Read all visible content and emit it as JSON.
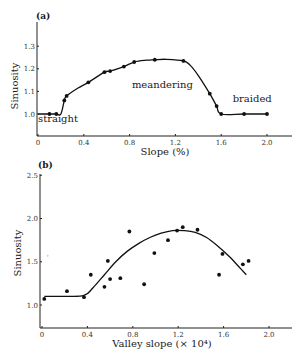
{
  "chart_data": [
    {
      "panel": "(a)",
      "type": "line",
      "title": "",
      "xlabel": "Slope (%)",
      "ylabel": "Sinuosity",
      "xlim": [
        0,
        2.2
      ],
      "ylim": [
        0.9,
        1.37
      ],
      "xticks": [
        0,
        0.4,
        0.8,
        1.2,
        1.6,
        2.0
      ],
      "xtick_labels": [
        "0",
        "0.4",
        "0.8",
        "1.2",
        "1.6",
        "2.0"
      ],
      "yticks": [
        1.0,
        1.1,
        1.2,
        1.3
      ],
      "ytick_labels": [
        "1.0",
        "1.1",
        "1.2",
        "1.3"
      ],
      "grid": false,
      "legend": null,
      "annotations": [
        {
          "text": "straight",
          "x": 0.0,
          "y": 0.965
        },
        {
          "text": "meandering",
          "x": 0.82,
          "y": 1.115
        },
        {
          "text": "braided",
          "x": 1.7,
          "y": 1.055
        }
      ],
      "series": [
        {
          "name": "observed",
          "style": "markers+line",
          "x": [
            0.1,
            0.16,
            0.23,
            0.25,
            0.44,
            0.58,
            0.63,
            0.75,
            0.84,
            1.02,
            1.27,
            1.5,
            1.56,
            1.6,
            1.8,
            2.0
          ],
          "y": [
            1.0,
            1.0,
            1.06,
            1.08,
            1.14,
            1.185,
            1.19,
            1.21,
            1.23,
            1.24,
            1.235,
            1.09,
            1.035,
            1.0,
            1.0,
            1.0
          ]
        }
      ],
      "curve": {
        "x": [
          0.0,
          0.1,
          0.16,
          0.2,
          0.23,
          0.25,
          0.35,
          0.44,
          0.58,
          0.63,
          0.75,
          0.84,
          0.95,
          1.02,
          1.12,
          1.27,
          1.33,
          1.4,
          1.5,
          1.56,
          1.6,
          1.8,
          2.0
        ],
        "y": [
          1.0,
          1.0,
          1.0,
          1.0,
          1.06,
          1.08,
          1.115,
          1.14,
          1.185,
          1.19,
          1.21,
          1.23,
          1.238,
          1.24,
          1.242,
          1.235,
          1.215,
          1.17,
          1.09,
          1.035,
          1.0,
          1.0,
          1.0
        ]
      }
    },
    {
      "panel": "(b)",
      "type": "scatter",
      "title": "",
      "xlabel": "Valley slope (× 10⁴)",
      "ylabel": "Sinuosity",
      "xlim": [
        0,
        2.2
      ],
      "ylim": [
        0.73,
        2.5
      ],
      "xticks": [
        0,
        0.4,
        0.8,
        1.2,
        1.6,
        2.0
      ],
      "xtick_labels": [
        "0",
        "0.4",
        "0.8",
        "1.2",
        "1.6",
        "2.0"
      ],
      "yticks": [
        1.0,
        1.5,
        2.0,
        2.5
      ],
      "ytick_labels": [
        "1.0",
        "1.5",
        "2.0",
        "2.5"
      ],
      "grid": false,
      "legend": null,
      "series": [
        {
          "name": "observed",
          "style": "markers",
          "x": [
            0.02,
            0.22,
            0.37,
            0.43,
            0.55,
            0.58,
            0.6,
            0.69,
            0.77,
            0.9,
            0.99,
            1.11,
            1.19,
            1.24,
            1.37,
            1.56,
            1.59,
            1.77,
            1.82
          ],
          "y": [
            1.07,
            1.16,
            1.09,
            1.35,
            1.21,
            1.51,
            1.3,
            1.31,
            1.85,
            1.24,
            1.6,
            1.75,
            1.86,
            1.9,
            1.87,
            1.35,
            1.59,
            1.47,
            1.51
          ]
        }
      ],
      "curve": {
        "name": "fitted trend",
        "x": [
          0.02,
          0.2,
          0.37,
          0.45,
          0.55,
          0.65,
          0.75,
          0.85,
          0.95,
          1.05,
          1.15,
          1.25,
          1.35,
          1.45,
          1.55,
          1.65,
          1.75,
          1.8
        ],
        "y": [
          1.1,
          1.1,
          1.11,
          1.2,
          1.35,
          1.5,
          1.62,
          1.71,
          1.78,
          1.83,
          1.86,
          1.86,
          1.84,
          1.78,
          1.68,
          1.56,
          1.42,
          1.35
        ]
      },
      "artifacts": [
        {
          "x": 0.05,
          "y": 1.57,
          "note": "faint speck"
        }
      ]
    }
  ],
  "labels": {
    "panel_a": "(a)",
    "panel_b": "(b)"
  }
}
